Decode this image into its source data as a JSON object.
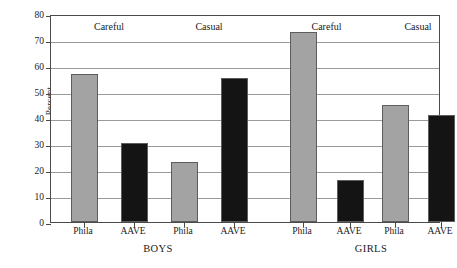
{
  "chart_data": {
    "type": "bar",
    "title": "",
    "xlabel": "",
    "ylabel": "Percent",
    "ylim": [
      0,
      80
    ],
    "yticks": [
      0,
      10,
      20,
      30,
      40,
      50,
      60,
      70,
      80
    ],
    "grid": true,
    "legend": "none",
    "categories": [
      "Phila",
      "AAVE",
      "Phila",
      "AAVE",
      "Phila",
      "AAVE",
      "Phila",
      "AAVE"
    ],
    "values": [
      57,
      30.5,
      23,
      55.5,
      73,
      16,
      45,
      41
    ],
    "bars": [
      {
        "label": "Phila",
        "value": 57,
        "group": "BOYS",
        "style": "Careful",
        "color": "#a3a3a3"
      },
      {
        "label": "AAVE",
        "value": 30.5,
        "group": "BOYS",
        "style": "Careful",
        "color": "#141414"
      },
      {
        "label": "Phila",
        "value": 23,
        "group": "BOYS",
        "style": "Casual",
        "color": "#a3a3a3"
      },
      {
        "label": "AAVE",
        "value": 55.5,
        "group": "BOYS",
        "style": "Casual",
        "color": "#141414"
      },
      {
        "label": "Phila",
        "value": 73,
        "group": "GIRLS",
        "style": "Careful",
        "color": "#a3a3a3"
      },
      {
        "label": "AAVE",
        "value": 16,
        "group": "GIRLS",
        "style": "Careful",
        "color": "#141414"
      },
      {
        "label": "Phila",
        "value": 45,
        "group": "GIRLS",
        "style": "Casual",
        "color": "#a3a3a3"
      },
      {
        "label": "AAVE",
        "value": 41,
        "group": "GIRLS",
        "style": "Casual",
        "color": "#141414"
      }
    ],
    "style_annotations": [
      {
        "text": "Careful",
        "group": "BOYS"
      },
      {
        "text": "Casual",
        "group": "BOYS"
      },
      {
        "text": "Careful",
        "group": "GIRLS"
      },
      {
        "text": "Casual",
        "group": "GIRLS"
      }
    ],
    "group_labels": [
      "BOYS",
      "GIRLS"
    ],
    "colors": {
      "phila_bar": "#a3a3a3",
      "aave_bar": "#141414",
      "gridline": "#9a9a9a",
      "axis": "#4a4a4a",
      "background": "#ffffff"
    }
  }
}
